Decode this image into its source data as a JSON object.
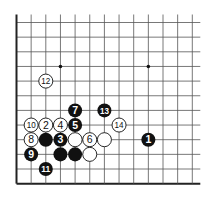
{
  "diagram": {
    "type": "go-board-fragment",
    "corner": "lower-left",
    "grid": {
      "cols": 13,
      "rows": 12,
      "origin_x": 16.5,
      "origin_y": 22.5,
      "spacing": 14.65,
      "line_color": "#555555",
      "edge_color": "#222222",
      "left_edge": true,
      "bottom_edge": true
    },
    "star_points": [
      {
        "col": 3,
        "row": 3
      },
      {
        "col": 9,
        "row": 3
      }
    ],
    "stones": [
      {
        "color": "black",
        "col": 9,
        "row": 8,
        "label": "1"
      },
      {
        "color": "white",
        "col": 2,
        "row": 7,
        "label": "2"
      },
      {
        "color": "black",
        "col": 3,
        "row": 8,
        "label": "3"
      },
      {
        "color": "white",
        "col": 3,
        "row": 7,
        "label": "4"
      },
      {
        "color": "black",
        "col": 4,
        "row": 7,
        "label": "5"
      },
      {
        "color": "white",
        "col": 5,
        "row": 8,
        "label": "6"
      },
      {
        "color": "black",
        "col": 4,
        "row": 6,
        "label": "7"
      },
      {
        "color": "white",
        "col": 1,
        "row": 8,
        "label": "8"
      },
      {
        "color": "black",
        "col": 1,
        "row": 9,
        "label": "9"
      },
      {
        "color": "white",
        "col": 1,
        "row": 7,
        "label": "10"
      },
      {
        "color": "black",
        "col": 2,
        "row": 10,
        "label": "11"
      },
      {
        "color": "white",
        "col": 2,
        "row": 4,
        "label": "12"
      },
      {
        "color": "black",
        "col": 6,
        "row": 6,
        "label": "13"
      },
      {
        "color": "white",
        "col": 7,
        "row": 7,
        "label": "14"
      },
      {
        "color": "black",
        "col": 2,
        "row": 8,
        "label": ""
      },
      {
        "color": "black",
        "col": 3,
        "row": 9,
        "label": ""
      },
      {
        "color": "black",
        "col": 4,
        "row": 9,
        "label": ""
      },
      {
        "color": "white",
        "col": 4,
        "row": 8,
        "label": ""
      },
      {
        "color": "white",
        "col": 6,
        "row": 8,
        "label": ""
      },
      {
        "color": "white",
        "col": 5,
        "row": 9,
        "label": ""
      }
    ]
  }
}
